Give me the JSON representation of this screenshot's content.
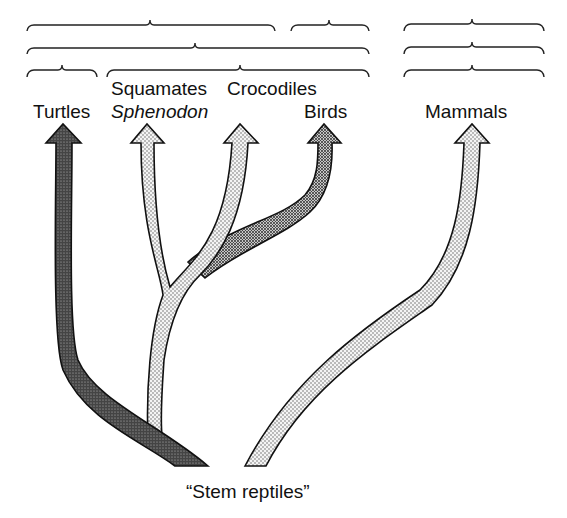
{
  "diagram": {
    "type": "phylogenetic-tree",
    "root_label": "“Stem reptiles”",
    "taxa": [
      {
        "id": "turtles",
        "label": "Turtles",
        "fill": "dark"
      },
      {
        "id": "squamates",
        "label": "Squamates",
        "fill": "light"
      },
      {
        "id": "sphenodon",
        "label": "Sphenodon",
        "italic": true,
        "fill": "light"
      },
      {
        "id": "crocodiles",
        "label": "Crocodiles",
        "fill": "light"
      },
      {
        "id": "birds",
        "label": "Birds",
        "fill": "medium"
      },
      {
        "id": "mammals",
        "label": "Mammals",
        "fill": "light"
      }
    ],
    "bracket_rows": 3,
    "colors": {
      "ink": "#111111",
      "dark_fill": "#3a3a3a",
      "medium_fill": "#7a7a7a",
      "light_fill": "#d8d8d8",
      "background": "#ffffff"
    }
  },
  "labels": {
    "turtles": "Turtles",
    "squamates": "Squamates",
    "sphenodon": "Sphenodon",
    "crocodiles": "Crocodiles",
    "birds": "Birds",
    "mammals": "Mammals",
    "stem": "“Stem reptiles”"
  }
}
